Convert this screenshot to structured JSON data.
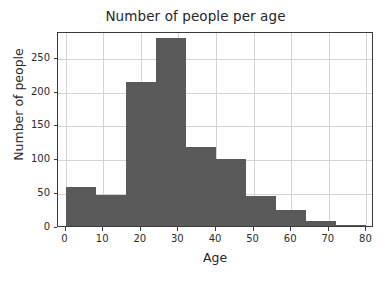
{
  "chart_data": {
    "type": "bar",
    "title": "Number of people per age",
    "xlabel": "Age",
    "ylabel": "Number of people",
    "grid": true,
    "legend": null,
    "xlim": [
      -2,
      82
    ],
    "ylim": [
      0,
      288
    ],
    "bin_width": 8,
    "bin_edges": [
      0,
      8,
      16,
      24,
      32,
      40,
      48,
      56,
      64,
      72,
      80
    ],
    "categories": [
      "0-8",
      "8-16",
      "16-24",
      "24-32",
      "32-40",
      "40-48",
      "48-56",
      "56-64",
      "64-72",
      "72-80"
    ],
    "values": [
      57,
      46,
      213,
      277,
      117,
      99,
      44,
      24,
      8,
      1
    ],
    "xticks": [
      0,
      10,
      20,
      30,
      40,
      50,
      60,
      70,
      80
    ],
    "xtick_labels": [
      "0",
      "10",
      "20",
      "30",
      "40",
      "50",
      "60",
      "70",
      "80"
    ],
    "yticks": [
      0,
      50,
      100,
      150,
      200,
      250
    ],
    "ytick_labels": [
      "0",
      "50",
      "100",
      "150",
      "200",
      "250"
    ],
    "bar_color": "#5a5a5a",
    "grid_color": "#d4d4d4",
    "axis_color": "#3b3b3b"
  }
}
